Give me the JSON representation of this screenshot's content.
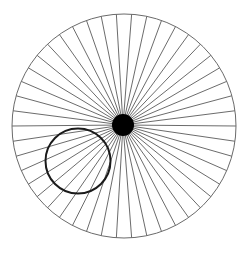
{
  "diagram": {
    "type": "radial-spoke-illusion",
    "canvas": {
      "width": 251,
      "height": 254,
      "background": "#ffffff"
    },
    "outer_circle": {
      "cx": 124,
      "cy": 126,
      "r": 112,
      "stroke": "#6a6a6a",
      "stroke_width": 1
    },
    "spokes": {
      "count": 46,
      "start_angle_deg": 0,
      "stroke": "#5a5a5a",
      "stroke_width": 0.9
    },
    "hub": {
      "cx": 123,
      "cy": 125,
      "r": 11,
      "fill": "#000000"
    },
    "ring": {
      "cx": 78,
      "cy": 161,
      "r": 32.5,
      "stroke": "#1a1a1a",
      "stroke_width": 2,
      "fill": "none"
    }
  }
}
